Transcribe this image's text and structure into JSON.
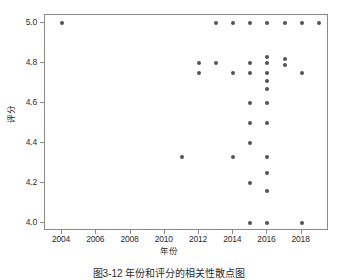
{
  "figure": {
    "caption": "图3-12 年份和评分的相关性散点图"
  },
  "chart_data": {
    "type": "scatter",
    "title": "",
    "xlabel": "年份",
    "ylabel": "评分",
    "xlim": [
      2003.0,
      2019.6
    ],
    "ylim": [
      3.96,
      5.04
    ],
    "grid": false,
    "legend": "none",
    "xticks": [
      2004,
      2006,
      2008,
      2010,
      2012,
      2014,
      2016,
      2018
    ],
    "xtick_labels": [
      "2004",
      "2006",
      "2008",
      "2010",
      "2012",
      "2014",
      "2016",
      "2018"
    ],
    "yticks": [
      4.0,
      4.2,
      4.4,
      4.6,
      4.8,
      5.0
    ],
    "ytick_labels": [
      "4.0",
      "4.2",
      "4.4",
      "4.6",
      "4.8",
      "5.0"
    ],
    "marker": "circle",
    "marker_color": "#535353",
    "marker_size": 4,
    "point_count": 40,
    "x": [
      2004,
      2013,
      2014,
      2015,
      2016,
      2017,
      2018,
      2019,
      2012,
      2013,
      2016,
      2016,
      2017,
      2015,
      2017,
      2012,
      2014,
      2015,
      2016,
      2018,
      2016,
      2016,
      2015,
      2016,
      2015,
      2016,
      2015,
      2011,
      2014,
      2016,
      2016,
      2015,
      2016,
      2015,
      2016,
      2018
    ],
    "y": [
      5.0,
      5.0,
      5.0,
      5.0,
      5.0,
      5.0,
      5.0,
      5.0,
      4.8,
      4.8,
      4.83,
      4.8,
      4.82,
      4.8,
      4.79,
      4.75,
      4.75,
      4.75,
      4.75,
      4.75,
      4.71,
      4.67,
      4.6,
      4.6,
      4.5,
      4.5,
      4.4,
      4.33,
      4.33,
      4.33,
      4.25,
      4.2,
      4.16,
      4.0,
      4.0,
      4.0
    ]
  }
}
